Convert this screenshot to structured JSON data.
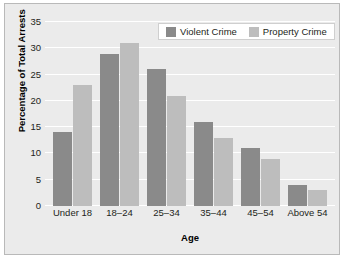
{
  "chart_data": {
    "type": "bar",
    "title": "",
    "xlabel": "Age",
    "ylabel": "Percentage of Total Arrests",
    "categories": [
      "Under 18",
      "18–24",
      "25–34",
      "35–44",
      "45–54",
      "Above 54"
    ],
    "series": [
      {
        "name": "Violent Crime",
        "color": "#8a8a8a",
        "values": [
          14,
          29,
          26,
          16,
          11,
          4
        ]
      },
      {
        "name": "Property Crime",
        "color": "#bdbdbd",
        "values": [
          23,
          31,
          21,
          13,
          9,
          3
        ]
      }
    ],
    "ylim": [
      0,
      35
    ],
    "yticks": [
      0,
      5,
      10,
      15,
      20,
      25,
      30,
      35
    ],
    "ytick_labels": [
      "0",
      "5",
      "10",
      "15",
      "20",
      "25",
      "30",
      "35"
    ],
    "grid": true,
    "grid_color": "#ffffff",
    "legend_position": "top-right",
    "plot_background": "#ebebeb",
    "panel_border_color": "#b9b9b9",
    "figure_background": "#ffffff",
    "text_color": "#231f20"
  }
}
